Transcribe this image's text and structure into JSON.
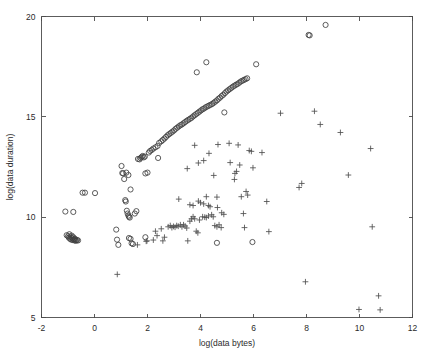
{
  "figure": {
    "background_color": "#ffffff",
    "axis_color": "#4a4a4a",
    "marker_circle_color": "#404040",
    "marker_plus_color": "#4f4f4f"
  },
  "chart_data": {
    "type": "scatter",
    "title": "",
    "subtitle": "",
    "xlabel": "log(data bytes)",
    "ylabel": "log(data duration)",
    "xlim": [
      -2,
      12
    ],
    "ylim": [
      5,
      20
    ],
    "xticks": [
      -2,
      0,
      2,
      4,
      6,
      8,
      10,
      12
    ],
    "xticklabels": [
      "-2",
      "0",
      "2",
      "4",
      "6",
      "8",
      "10",
      "12"
    ],
    "yticks": [
      5,
      10,
      15,
      20
    ],
    "yticklabels": [
      "5",
      "10",
      "15",
      "20"
    ],
    "grid": false,
    "legend": null,
    "legend_position": "none",
    "annotations": [],
    "series": [
      {
        "name": "circles",
        "marker": "o",
        "color": "#404040",
        "points": [
          [
            -1.05,
            9.1
          ],
          [
            -1.0,
            9.05
          ],
          [
            -0.97,
            8.98
          ],
          [
            -0.95,
            9.15
          ],
          [
            -0.92,
            8.92
          ],
          [
            -0.9,
            9.02
          ],
          [
            -0.88,
            8.88
          ],
          [
            -0.86,
            9.08
          ],
          [
            -0.84,
            8.95
          ],
          [
            -0.82,
            8.86
          ],
          [
            -0.8,
            9.0
          ],
          [
            -0.78,
            8.9
          ],
          [
            -0.76,
            8.84
          ],
          [
            -0.74,
            8.93
          ],
          [
            -0.72,
            8.87
          ],
          [
            -0.7,
            8.82
          ],
          [
            -0.66,
            8.86
          ],
          [
            -0.62,
            8.84
          ],
          [
            -1.1,
            10.28
          ],
          [
            -0.8,
            10.26
          ],
          [
            -0.45,
            11.22
          ],
          [
            -0.36,
            11.22
          ],
          [
            0.02,
            11.2
          ],
          [
            0.82,
            9.38
          ],
          [
            0.85,
            8.88
          ],
          [
            0.9,
            8.62
          ],
          [
            1.02,
            12.55
          ],
          [
            1.05,
            12.2
          ],
          [
            1.08,
            12.18
          ],
          [
            1.12,
            11.9
          ],
          [
            1.16,
            10.85
          ],
          [
            1.18,
            10.78
          ],
          [
            1.22,
            10.32
          ],
          [
            1.25,
            10.18
          ],
          [
            1.28,
            10.08
          ],
          [
            1.3,
            10.02
          ],
          [
            1.33,
            9.98
          ],
          [
            1.2,
            12.22
          ],
          [
            1.28,
            12.1
          ],
          [
            1.36,
            11.38
          ],
          [
            1.3,
            8.96
          ],
          [
            1.36,
            8.92
          ],
          [
            1.4,
            8.7
          ],
          [
            1.45,
            8.66
          ],
          [
            1.52,
            10.18
          ],
          [
            1.58,
            10.3
          ],
          [
            1.64,
            12.9
          ],
          [
            1.7,
            12.88
          ],
          [
            1.74,
            12.95
          ],
          [
            1.78,
            13.0
          ],
          [
            1.82,
            13.05
          ],
          [
            1.86,
            12.98
          ],
          [
            1.9,
            13.02
          ],
          [
            1.92,
            12.18
          ],
          [
            2.0,
            12.22
          ],
          [
            1.92,
            9.0
          ],
          [
            2.05,
            13.22
          ],
          [
            2.1,
            13.3
          ],
          [
            2.16,
            13.35
          ],
          [
            2.22,
            13.42
          ],
          [
            2.3,
            13.48
          ],
          [
            2.38,
            13.55
          ],
          [
            2.44,
            13.7
          ],
          [
            2.4,
            12.95
          ],
          [
            2.52,
            13.78
          ],
          [
            2.58,
            13.85
          ],
          [
            2.64,
            13.92
          ],
          [
            2.7,
            14.0
          ],
          [
            2.76,
            14.08
          ],
          [
            2.82,
            14.14
          ],
          [
            2.88,
            14.2
          ],
          [
            2.94,
            14.26
          ],
          [
            3.0,
            14.32
          ],
          [
            3.06,
            14.4
          ],
          [
            3.12,
            14.46
          ],
          [
            3.18,
            14.52
          ],
          [
            3.24,
            14.58
          ],
          [
            3.3,
            14.62
          ],
          [
            3.36,
            14.68
          ],
          [
            3.42,
            14.74
          ],
          [
            3.48,
            14.8
          ],
          [
            3.54,
            14.85
          ],
          [
            3.6,
            14.9
          ],
          [
            3.66,
            14.95
          ],
          [
            3.72,
            15.02
          ],
          [
            3.78,
            15.08
          ],
          [
            3.84,
            15.14
          ],
          [
            3.9,
            15.2
          ],
          [
            3.96,
            15.26
          ],
          [
            4.02,
            15.32
          ],
          [
            4.08,
            15.38
          ],
          [
            4.14,
            15.42
          ],
          [
            4.2,
            15.48
          ],
          [
            4.26,
            15.52
          ],
          [
            4.32,
            15.56
          ],
          [
            4.38,
            15.6
          ],
          [
            4.44,
            15.64
          ],
          [
            4.5,
            15.7
          ],
          [
            4.56,
            15.76
          ],
          [
            4.62,
            15.82
          ],
          [
            4.68,
            15.9
          ],
          [
            4.74,
            15.96
          ],
          [
            4.8,
            16.04
          ],
          [
            4.86,
            16.1
          ],
          [
            4.92,
            16.18
          ],
          [
            4.98,
            16.26
          ],
          [
            5.04,
            16.32
          ],
          [
            5.1,
            16.38
          ],
          [
            5.16,
            16.44
          ],
          [
            5.22,
            16.5
          ],
          [
            5.28,
            16.55
          ],
          [
            5.34,
            16.6
          ],
          [
            5.4,
            16.64
          ],
          [
            5.46,
            16.7
          ],
          [
            5.52,
            16.76
          ],
          [
            5.58,
            16.8
          ],
          [
            5.64,
            16.84
          ],
          [
            5.7,
            16.88
          ],
          [
            5.76,
            16.92
          ],
          [
            4.9,
            15.22
          ],
          [
            3.86,
            17.22
          ],
          [
            4.22,
            17.72
          ],
          [
            6.1,
            17.62
          ],
          [
            8.08,
            19.08
          ],
          [
            8.12,
            19.06
          ],
          [
            8.72,
            19.58
          ],
          [
            4.62,
            8.72
          ],
          [
            5.96,
            8.76
          ]
        ]
      },
      {
        "name": "plus",
        "marker": "+",
        "color": "#4f4f4f",
        "points": [
          [
            0.86,
            7.15
          ],
          [
            1.62,
            8.62
          ],
          [
            1.95,
            8.8
          ],
          [
            1.98,
            8.82
          ],
          [
            2.22,
            8.86
          ],
          [
            2.3,
            9.3
          ],
          [
            2.36,
            9.08
          ],
          [
            2.52,
            9.42
          ],
          [
            2.58,
            8.82
          ],
          [
            2.64,
            9.0
          ],
          [
            2.78,
            9.52
          ],
          [
            2.86,
            9.58
          ],
          [
            2.92,
            9.48
          ],
          [
            2.98,
            9.54
          ],
          [
            3.04,
            9.5
          ],
          [
            3.1,
            9.58
          ],
          [
            3.16,
            9.55
          ],
          [
            3.24,
            9.62
          ],
          [
            3.3,
            9.52
          ],
          [
            3.36,
            9.62
          ],
          [
            3.42,
            9.56
          ],
          [
            3.48,
            9.46
          ],
          [
            3.52,
            8.82
          ],
          [
            3.6,
            9.8
          ],
          [
            3.66,
            9.92
          ],
          [
            3.72,
            10.02
          ],
          [
            3.78,
            9.92
          ],
          [
            3.84,
            9.3
          ],
          [
            3.9,
            9.22
          ],
          [
            3.96,
            9.86
          ],
          [
            4.08,
            10.02
          ],
          [
            4.16,
            10.0
          ],
          [
            4.22,
            9.98
          ],
          [
            4.3,
            10.06
          ],
          [
            4.36,
            10.52
          ],
          [
            4.42,
            10.12
          ],
          [
            4.48,
            10.02
          ],
          [
            4.54,
            9.58
          ],
          [
            4.62,
            9.52
          ],
          [
            4.7,
            9.62
          ],
          [
            4.78,
            9.48
          ],
          [
            3.18,
            10.9
          ],
          [
            3.6,
            10.62
          ],
          [
            3.72,
            10.58
          ],
          [
            3.92,
            10.8
          ],
          [
            4.0,
            10.72
          ],
          [
            4.12,
            10.66
          ],
          [
            4.22,
            11.02
          ],
          [
            4.3,
            10.58
          ],
          [
            4.64,
            10.48
          ],
          [
            4.8,
            10.22
          ],
          [
            4.88,
            10.14
          ],
          [
            3.5,
            12.42
          ],
          [
            3.78,
            13.58
          ],
          [
            3.92,
            12.7
          ],
          [
            4.12,
            12.82
          ],
          [
            4.32,
            13.18
          ],
          [
            4.5,
            12.08
          ],
          [
            4.62,
            11.0
          ],
          [
            4.66,
            13.62
          ],
          [
            5.08,
            13.68
          ],
          [
            5.12,
            12.72
          ],
          [
            5.28,
            11.88
          ],
          [
            5.3,
            12.18
          ],
          [
            5.36,
            12.28
          ],
          [
            5.42,
            13.6
          ],
          [
            5.48,
            12.6
          ],
          [
            5.54,
            11.02
          ],
          [
            5.62,
            10.18
          ],
          [
            5.66,
            9.48
          ],
          [
            5.72,
            11.28
          ],
          [
            5.78,
            11.1
          ],
          [
            5.84,
            13.32
          ],
          [
            5.92,
            13.28
          ],
          [
            5.98,
            12.46
          ],
          [
            6.32,
            13.22
          ],
          [
            6.5,
            10.78
          ],
          [
            6.58,
            9.28
          ],
          [
            7.02,
            15.18
          ],
          [
            7.72,
            11.48
          ],
          [
            7.82,
            11.68
          ],
          [
            7.96,
            6.78
          ],
          [
            8.3,
            15.28
          ],
          [
            8.52,
            14.62
          ],
          [
            9.28,
            14.22
          ],
          [
            9.58,
            12.1
          ],
          [
            9.98,
            5.4
          ],
          [
            10.42,
            13.42
          ],
          [
            10.48,
            9.52
          ],
          [
            10.72,
            6.08
          ],
          [
            10.78,
            5.38
          ]
        ]
      }
    ]
  }
}
